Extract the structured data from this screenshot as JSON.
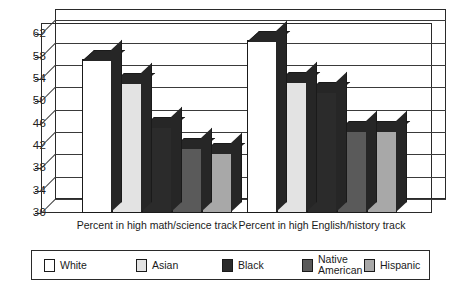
{
  "chart_data": {
    "type": "bar",
    "title": "",
    "subtitle": "",
    "xlabel": "",
    "ylabel": "",
    "ylim": [
      30,
      64
    ],
    "yticks": [
      30,
      34,
      38,
      42,
      46,
      50,
      54,
      58,
      62
    ],
    "ytick_step": 4,
    "grid": true,
    "legend_position": "bottom",
    "style": "3d-bar",
    "categories": [
      "Percent in high math/science track",
      "Percent in high English/history track"
    ],
    "series": [
      {
        "name": "White",
        "values": [
          57.5,
          61.0
        ],
        "color": "#ffffff"
      },
      {
        "name": "Asian",
        "values": [
          53.5,
          53.7
        ],
        "color": "#e3e3e3"
      },
      {
        "name": "Black",
        "values": [
          45.5,
          51.8
        ],
        "color": "#2b2b2b"
      },
      {
        "name": "Native\nAmerican",
        "values": [
          41.8,
          44.8
        ],
        "color": "#5a5a5a"
      },
      {
        "name": "Hispanic",
        "values": [
          41.0,
          44.8
        ],
        "color": "#a8a8a8"
      }
    ]
  },
  "axis": {
    "tick_labels": [
      "62",
      "58",
      "54",
      "50",
      "46",
      "42",
      "38",
      "34",
      "30"
    ]
  },
  "xlabels": {
    "group1": "Percent in high math/science track",
    "group2": "Percent in high English/history track"
  },
  "legend": {
    "items": [
      {
        "label": "White",
        "color": "#ffffff"
      },
      {
        "label": "Asian",
        "color": "#e3e3e3"
      },
      {
        "label": "Black",
        "color": "#2b2b2b"
      },
      {
        "label": "Native\nAmerican",
        "color": "#5a5a5a"
      },
      {
        "label": "Hispanic",
        "color": "#a8a8a8"
      }
    ]
  },
  "colors": {
    "axis": "#2a2a2a",
    "grid": "#3a3a3a",
    "bar_shadow": "#262626",
    "text": "#1a1a1a",
    "background": "#ffffff"
  }
}
